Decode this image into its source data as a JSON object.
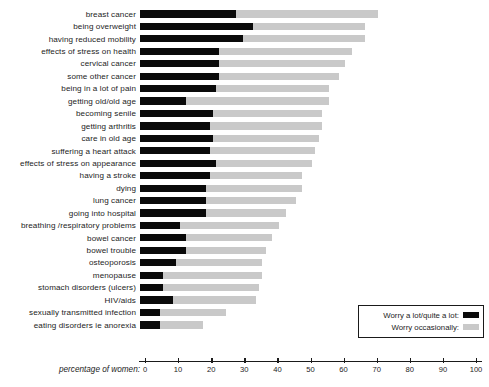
{
  "chart_data": {
    "type": "bar",
    "orientation": "horizontal",
    "stacked": true,
    "title": "",
    "xlabel": "percentage of women:",
    "ylabel": "",
    "xlim": [
      0,
      100
    ],
    "xticks": [
      0,
      10,
      20,
      30,
      40,
      50,
      60,
      70,
      80,
      90,
      100
    ],
    "grid": false,
    "legend_position": "bottom-right",
    "colors": {
      "worry_a_lot": "#0a0a0a",
      "worry_occasionally": "#c9c9c9",
      "axis": "#1a1a1a",
      "text": "#1c1c1c",
      "background": "#ffffff"
    },
    "categories": [
      "breast cancer",
      "being overweight",
      "having reduced mobility",
      "effects of stress on health",
      "cervical cancer",
      "some other cancer",
      "being in a lot of pain",
      "getting old/old age",
      "becoming senile",
      "getting arthritis",
      "care in old age",
      "suffering a heart attack",
      "effects of stress on appearance",
      "having a stroke",
      "dying",
      "lung cancer",
      "going into hospital",
      "breathing /respiratory problems",
      "bowel cancer",
      "bowel trouble",
      "osteoporosis",
      "menopause",
      "stomach disorders (ulcers)",
      "HIV/aids",
      "sexually transmitted infection",
      "eating disorders ie anorexia"
    ],
    "series": [
      {
        "name": "Worry a lot/quite a lot:",
        "color": "#0a0a0a",
        "values": [
          29,
          34,
          31,
          24,
          24,
          24,
          23,
          14,
          22,
          21,
          22,
          21,
          23,
          21,
          20,
          20,
          20,
          12,
          14,
          14,
          11,
          7,
          7,
          10,
          6,
          6
        ]
      },
      {
        "name": "Worry occasionally:",
        "color": "#c9c9c9",
        "values": [
          43,
          34,
          37,
          40,
          38,
          36,
          34,
          43,
          33,
          34,
          32,
          32,
          29,
          28,
          29,
          27,
          24,
          30,
          26,
          24,
          26,
          30,
          29,
          25,
          20,
          13
        ]
      }
    ],
    "totals": [
      72,
      68,
      68,
      64,
      62,
      60,
      57,
      57,
      55,
      55,
      54,
      53,
      52,
      49,
      49,
      47,
      44,
      42,
      40,
      38,
      37,
      37,
      36,
      35,
      26,
      19
    ]
  },
  "axis": {
    "title": "percentage of women:",
    "ticks": [
      "0",
      "10",
      "20",
      "30",
      "40",
      "50",
      "60",
      "70",
      "80",
      "90",
      "100"
    ]
  },
  "legend": {
    "items": [
      {
        "label": "Worry a lot/quite a lot:",
        "swatch": "black-swatch"
      },
      {
        "label": "Worry occasionally:",
        "swatch": "gray-swatch"
      }
    ]
  }
}
